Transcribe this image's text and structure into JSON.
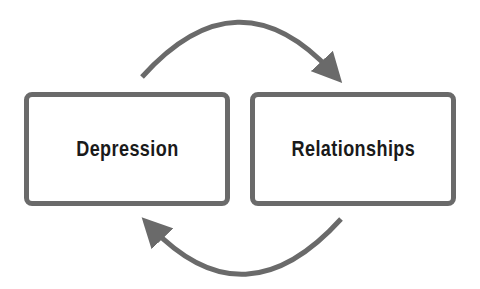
{
  "diagram": {
    "type": "cycle",
    "nodes": [
      {
        "id": "depression",
        "label": "Depression"
      },
      {
        "id": "relationships",
        "label": "Relationships"
      }
    ],
    "edges": [
      {
        "from": "depression",
        "to": "relationships",
        "position": "top",
        "style": "curved-arrow"
      },
      {
        "from": "relationships",
        "to": "depression",
        "position": "bottom",
        "style": "curved-arrow"
      }
    ],
    "colors": {
      "stroke": "#6a6a6a",
      "text": "#1a1a1a",
      "background": "#ffffff"
    }
  }
}
